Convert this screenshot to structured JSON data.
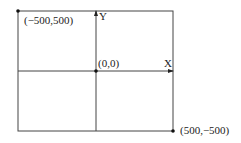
{
  "diagram": {
    "type": "coordinate-system",
    "labels": {
      "top_left": "(−500,500)",
      "origin": "(0,0)",
      "bottom_right": "(500,−500)",
      "x_axis": "X",
      "y_axis": "Y"
    },
    "colors": {
      "line": "#333333",
      "background": "#ffffff"
    }
  }
}
